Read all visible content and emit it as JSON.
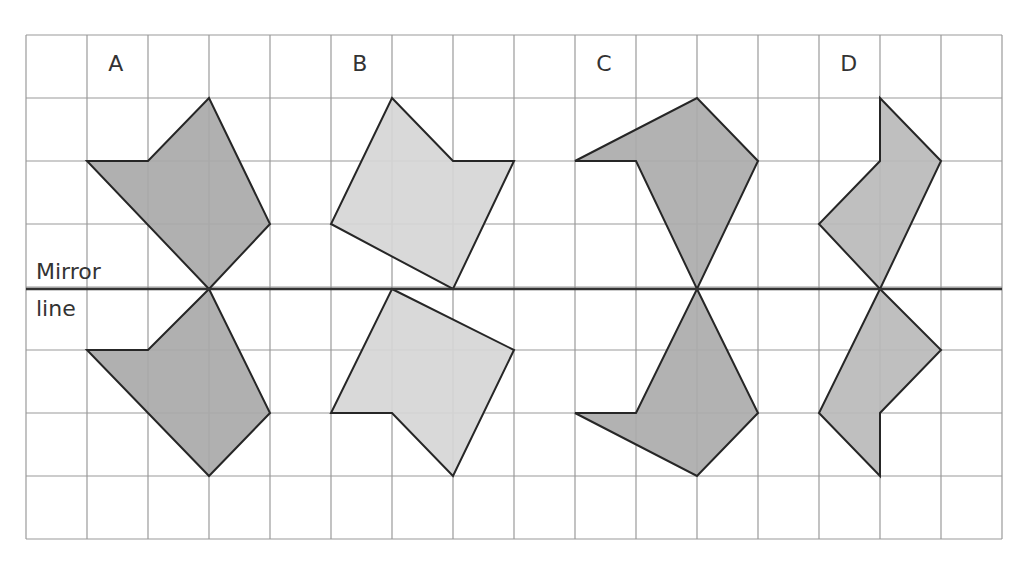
{
  "diagram": {
    "type": "reflection-grid",
    "grid": {
      "columns": 16,
      "rows": 8,
      "left": 26,
      "top": 35,
      "cell_w": 61,
      "cell_h": 63,
      "line_color": "#9a9a9a"
    },
    "mirror_line": {
      "row": 4,
      "label_line1": "Mirror",
      "label_line2": "line",
      "color": "#333333"
    },
    "stroke_color": "#262626",
    "shapes": [
      {
        "label": "A",
        "label_pos": [
          1.35,
          0.45
        ],
        "fill": "#a9a9a9",
        "top": [
          [
            1,
            2
          ],
          [
            2,
            2
          ],
          [
            3,
            1
          ],
          [
            4,
            3
          ],
          [
            3,
            4
          ]
        ],
        "bottom": [
          [
            1,
            5
          ],
          [
            2,
            5
          ],
          [
            3,
            4
          ],
          [
            4,
            6
          ],
          [
            3,
            7
          ]
        ]
      },
      {
        "label": "B",
        "label_pos": [
          5.35,
          0.45
        ],
        "fill": "#d6d6d6",
        "top": [
          [
            6,
            1
          ],
          [
            7,
            2
          ],
          [
            8,
            2
          ],
          [
            7,
            4
          ],
          [
            5,
            3
          ]
        ],
        "bottom": [
          [
            6,
            4
          ],
          [
            8,
            5
          ],
          [
            7,
            7
          ],
          [
            6,
            6
          ],
          [
            5,
            6
          ]
        ]
      },
      {
        "label": "C",
        "label_pos": [
          9.35,
          0.45
        ],
        "fill": "#ababab",
        "top": [
          [
            9,
            2
          ],
          [
            11,
            1
          ],
          [
            12,
            2
          ],
          [
            11,
            4
          ],
          [
            10,
            2
          ]
        ],
        "bottom": [
          [
            11,
            4
          ],
          [
            12,
            6
          ],
          [
            11,
            7
          ],
          [
            9,
            6
          ],
          [
            10,
            6
          ]
        ]
      },
      {
        "label": "D",
        "label_pos": [
          13.35,
          0.45
        ],
        "fill": "#bababa",
        "top": [
          [
            14,
            1
          ],
          [
            15,
            2
          ],
          [
            14,
            4
          ],
          [
            13,
            3
          ],
          [
            14,
            2
          ]
        ],
        "bottom": [
          [
            14,
            4
          ],
          [
            15,
            5
          ],
          [
            14,
            6
          ],
          [
            14,
            7
          ],
          [
            13,
            6
          ]
        ]
      }
    ]
  }
}
